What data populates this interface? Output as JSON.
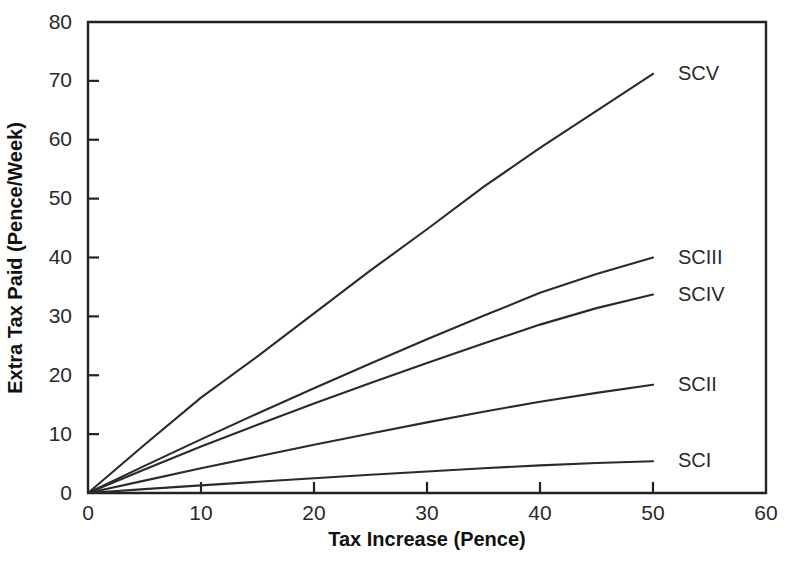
{
  "chart_data": {
    "type": "line",
    "title": "",
    "subtitle": "",
    "xlabel": "Tax Increase (Pence)",
    "ylabel": "Extra Tax Paid (Pence/Week)",
    "xlim": [
      0,
      60
    ],
    "ylim": [
      0,
      80
    ],
    "xticks": [
      0,
      10,
      20,
      30,
      40,
      50,
      60
    ],
    "yticks": [
      0,
      10,
      20,
      30,
      40,
      50,
      60,
      70,
      80
    ],
    "xtick_labels": [
      "0",
      "10",
      "20",
      "30",
      "40",
      "50",
      "60"
    ],
    "ytick_labels": [
      "0",
      "10",
      "20",
      "30",
      "40",
      "50",
      "60",
      "70",
      "80"
    ],
    "grid": false,
    "legend_position": "right-inline-labels",
    "line_color": "#2b2b2b",
    "axis_color": "#222222",
    "background_color": "#ffffff",
    "x": [
      0,
      5,
      10,
      15,
      20,
      25,
      30,
      35,
      40,
      45,
      50
    ],
    "series": [
      {
        "name": "SCV",
        "label": "SCV",
        "values": [
          0,
          8.2,
          16.2,
          23.2,
          30.5,
          37.8,
          44.8,
          52.0,
          58.6,
          64.9,
          71.2
        ],
        "endpoint": {
          "x": 50,
          "y": 71.2
        }
      },
      {
        "name": "SCIII",
        "label": "SCIII",
        "values": [
          0,
          4.6,
          9.1,
          13.5,
          17.8,
          22.0,
          26.1,
          30.1,
          34.0,
          37.2,
          40.0
        ],
        "endpoint": {
          "x": 50,
          "y": 40.0
        }
      },
      {
        "name": "SCIV",
        "label": "SCIV",
        "values": [
          0,
          4.0,
          7.9,
          11.6,
          15.2,
          18.7,
          22.1,
          25.4,
          28.6,
          31.4,
          33.7
        ],
        "endpoint": {
          "x": 50,
          "y": 33.7
        }
      },
      {
        "name": "SCII",
        "label": "SCII",
        "values": [
          0,
          2.1,
          4.2,
          6.2,
          8.2,
          10.1,
          12.0,
          13.8,
          15.5,
          17.0,
          18.4
        ],
        "endpoint": {
          "x": 50,
          "y": 18.4
        }
      },
      {
        "name": "SCI",
        "label": "SCI",
        "values": [
          0,
          0.65,
          1.3,
          1.9,
          2.5,
          3.1,
          3.65,
          4.2,
          4.7,
          5.1,
          5.4
        ],
        "endpoint": {
          "x": 50,
          "y": 5.4
        }
      }
    ],
    "series_labels": [
      "SCV",
      "SCIII",
      "SCIV",
      "SCII",
      "SCI"
    ]
  }
}
